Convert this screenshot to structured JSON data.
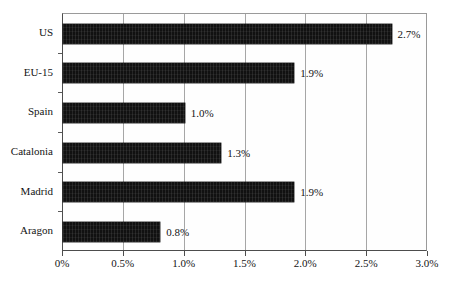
{
  "chart_data": {
    "type": "bar",
    "orientation": "horizontal",
    "title": "",
    "subtitle": "",
    "xlabel": "",
    "ylabel": "",
    "categories": [
      "US",
      "EU-15",
      "Spain",
      "Catalonia",
      "Madrid",
      "Aragon"
    ],
    "values": [
      2.7,
      1.9,
      1.0,
      1.3,
      1.9,
      0.8
    ],
    "value_labels": [
      "2.7%",
      "1.9%",
      "1.0%",
      "1.3%",
      "1.9%",
      "0.8%"
    ],
    "xlim": [
      0,
      3.0
    ],
    "xticks": [
      0,
      0.5,
      1.0,
      1.5,
      2.0,
      2.5,
      3.0
    ],
    "xtick_labels": [
      "0%",
      "0.5%",
      "1.0%",
      "1.5%",
      "2.0%",
      "2.5%",
      "3.0%"
    ],
    "grid": "vertical",
    "legend": "none",
    "bar_color": "#111111",
    "gridline_color": "#a6a6a6",
    "axis_color": "#4d4d4d",
    "background_color": "#ffffff"
  }
}
